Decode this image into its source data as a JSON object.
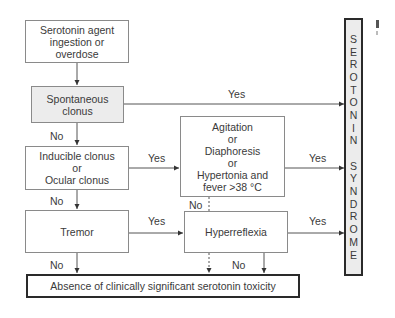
{
  "diagram": {
    "nodes": {
      "start": "Serotonin agent\ningestion or\noverdose",
      "spontaneous": "Spontaneous\nclonus",
      "inducible": "Inducible clonus\nor\nOcular clonus",
      "agitation": "Agitation\nor\nDiaphoresis\nor\nHypertonia and\nfever >38 °C",
      "tremor": "Tremor",
      "hyperreflexia": "Hyperreflexia",
      "absence": "Absence of clinically significant serotonin toxicity",
      "outcome_letters": [
        "S",
        "E",
        "R",
        "O",
        "T",
        "O",
        "N",
        "I",
        "N",
        " ",
        "S",
        "Y",
        "N",
        "D",
        "R",
        "O",
        "M",
        "E"
      ],
      "outcome": "SEROTONIN SYNDROME"
    },
    "edge_labels": {
      "spontaneous_yes": "Yes",
      "spontaneous_no": "No",
      "inducible_yes": "Yes",
      "inducible_no": "No",
      "agitation_yes": "Yes",
      "agitation_no": "No",
      "tremor_yes": "Yes",
      "tremor_no": "No",
      "hyperreflexia_yes": "Yes",
      "hyperreflexia_no": "No"
    },
    "colors": {
      "line": "#555555",
      "highlight_fill": "#ececec",
      "thick_border": "#2a2a2a"
    }
  }
}
